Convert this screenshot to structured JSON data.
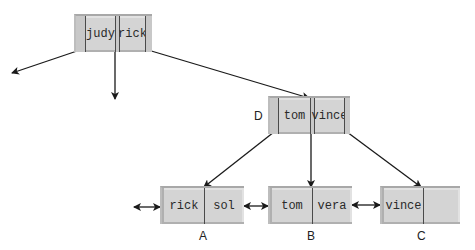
{
  "diagram": {
    "type": "B+ tree",
    "colors": {
      "node_fill": "#d4d4d4",
      "edge": "#1a1a1a"
    },
    "root": {
      "keys": [
        "judy",
        "rick"
      ]
    },
    "internal": {
      "label": "D",
      "keys": [
        "tom",
        "vince"
      ]
    },
    "leaves": [
      {
        "label": "A",
        "keys": [
          "rick",
          "sol"
        ]
      },
      {
        "label": "B",
        "keys": [
          "tom",
          "vera"
        ]
      },
      {
        "label": "C",
        "keys": [
          "vince",
          ""
        ]
      }
    ],
    "edges": [
      "root -> (off-diagram left child)",
      "root -> (off-diagram middle child)",
      "root -> D",
      "D -> A",
      "D -> B",
      "D -> C",
      "(prev leaf) <-> A",
      "A <-> B",
      "B <-> C"
    ]
  }
}
